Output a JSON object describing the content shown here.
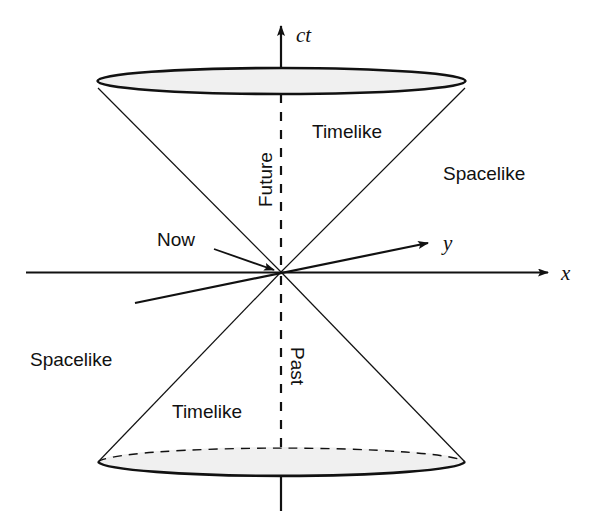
{
  "figure": {
    "kind": "light-cone-spacetime-diagram",
    "background_color": "#ffffff",
    "ink_color": "#111111",
    "disc_fill_color": "#f0f0f0"
  },
  "axes": {
    "time": {
      "label": "ct",
      "name": "time-axis",
      "orientation": "vertical",
      "arrow": "up"
    },
    "x": {
      "label": "x",
      "name": "x-axis",
      "orientation": "horizontal",
      "arrow": "right"
    },
    "y": {
      "label": "y",
      "name": "y-axis",
      "orientation": "oblique",
      "arrow": "upper-right"
    }
  },
  "annotations": {
    "now": "Now",
    "future": "Future",
    "past": "Past",
    "timelike_upper": "Timelike",
    "timelike_lower": "Timelike",
    "spacelike_right": "Spacelike",
    "spacelike_left": "Spacelike"
  }
}
